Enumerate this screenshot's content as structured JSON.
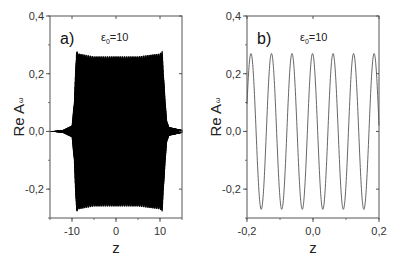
{
  "chart_data": [
    {
      "type": "line",
      "panel_label": "a)",
      "annotation": {
        "symbol": "ε",
        "subscript": "0",
        "text": "=10"
      },
      "title": "",
      "xlabel": "z",
      "ylabel": "Re A",
      "ylabel_subscript": "ω",
      "xlim": [
        -15,
        15
      ],
      "ylim": [
        -0.3,
        0.4
      ],
      "xticks": [
        -10,
        0,
        10
      ],
      "xtick_labels": [
        "-10",
        "0",
        "10"
      ],
      "yticks": [
        -0.2,
        0.0,
        0.2,
        0.4
      ],
      "ytick_labels": [
        "-0,2",
        "0,0",
        "0,2",
        "0,4"
      ],
      "grid": false,
      "description": "Rapidly oscillating signal with envelope ~0 outside, rising near z=-9 and falling near z=11; plateau amplitude ~0.26 with edge overshoot ~0.28",
      "envelope": {
        "z": [
          -15,
          -12,
          -10,
          -9.5,
          -9,
          -8.5,
          -5,
          0,
          5,
          10,
          10.5,
          11,
          11.5,
          12,
          15
        ],
        "amplitude": [
          0.0,
          0.005,
          0.02,
          0.1,
          0.28,
          0.27,
          0.26,
          0.26,
          0.26,
          0.27,
          0.28,
          0.15,
          0.04,
          0.015,
          0.005
        ]
      },
      "line_color": "#000000"
    },
    {
      "type": "line",
      "panel_label": "b)",
      "annotation": {
        "symbol": "ε",
        "subscript": "0",
        "text": "=10"
      },
      "title": "",
      "xlabel": "z",
      "ylabel": "Re A",
      "ylabel_subscript": "ω",
      "xlim": [
        -0.2,
        0.2
      ],
      "ylim": [
        -0.3,
        0.4
      ],
      "xticks": [
        -0.2,
        0.0,
        0.2
      ],
      "xtick_labels": [
        "-0,2",
        "0,0",
        "0,2"
      ],
      "yticks": [
        -0.2,
        0.0,
        0.2,
        0.4
      ],
      "ytick_labels": [
        "-0,2",
        "0,0",
        "0,2",
        "0,4"
      ],
      "grid": false,
      "description": "Zoomed view: sinusoidal oscillation, amplitude ~0.27, period ~0.062",
      "amplitude": 0.27,
      "period": 0.0622,
      "peaks_z": [
        -0.188,
        -0.126,
        -0.064,
        -0.003,
        0.06,
        0.121,
        0.185
      ],
      "troughs_z": [
        -0.155,
        -0.094,
        -0.033,
        0.03,
        0.091,
        0.155
      ],
      "line_color": "#555555"
    }
  ]
}
